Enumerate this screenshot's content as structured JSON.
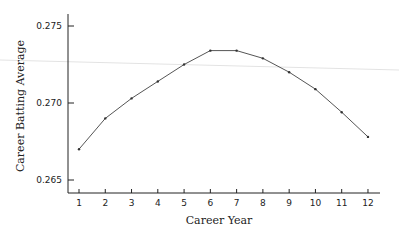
{
  "chart_data": {
    "type": "line",
    "title": "",
    "xlabel": "Career Year",
    "ylabel": "Career Batting Average",
    "x": [
      1,
      2,
      3,
      4,
      5,
      6,
      7,
      8,
      9,
      10,
      11,
      12
    ],
    "series": [
      {
        "name": "Career Batting Average",
        "values": [
          0.267,
          0.269,
          0.2703,
          0.2714,
          0.2725,
          0.2734,
          0.2734,
          0.2729,
          0.272,
          0.2709,
          0.2694,
          0.2678
        ]
      }
    ],
    "x_ticks": [
      "1",
      "2",
      "3",
      "4",
      "5",
      "6",
      "7",
      "8",
      "9",
      "10",
      "11",
      "12"
    ],
    "y_ticks": [
      "0.265",
      "0.270",
      "0.275"
    ],
    "ylim": [
      0.2645,
      0.2762
    ],
    "xlim": [
      0.6,
      12.5
    ],
    "grid": false,
    "legend": "none"
  },
  "colors": {
    "line": "#555555",
    "axis": "#222222",
    "artifact_line": "#d9d9d9"
  }
}
